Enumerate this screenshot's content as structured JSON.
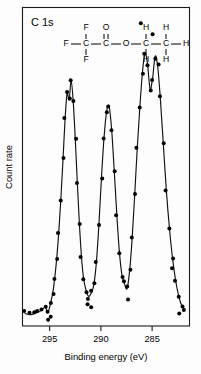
{
  "figure": {
    "panel_label": "C 1s"
  },
  "structure": {
    "name": "ethyl-trifluoroacetate",
    "atoms": [
      {
        "id": "F-left",
        "label": "F",
        "x": 66,
        "y": 44
      },
      {
        "id": "F-top",
        "label": "F",
        "x": 86,
        "y": 28
      },
      {
        "id": "F-bottom",
        "label": "F",
        "x": 86,
        "y": 60
      },
      {
        "id": "C1",
        "label": "C",
        "x": 86,
        "y": 44
      },
      {
        "id": "C2",
        "label": "C",
        "x": 106,
        "y": 44
      },
      {
        "id": "O-double",
        "label": "O",
        "x": 106,
        "y": 28
      },
      {
        "id": "O-ester",
        "label": "O",
        "x": 126,
        "y": 44
      },
      {
        "id": "C3",
        "label": "C",
        "x": 146,
        "y": 44
      },
      {
        "id": "H-c3-top",
        "label": "H",
        "x": 146,
        "y": 28
      },
      {
        "id": "H-c3-bot",
        "label": "H",
        "x": 146,
        "y": 60
      },
      {
        "id": "C4",
        "label": "C",
        "x": 166,
        "y": 44
      },
      {
        "id": "H-c4-top",
        "label": "H",
        "x": 166,
        "y": 28
      },
      {
        "id": "H-c4-bot",
        "label": "H",
        "x": 166,
        "y": 60
      },
      {
        "id": "H-right",
        "label": "H",
        "x": 186,
        "y": 44
      }
    ]
  },
  "chart_data": {
    "type": "line",
    "title": "C 1s",
    "xlabel": "Binding  energy  (eV)",
    "ylabel": "Count  rate",
    "xlim": [
      297.6,
      281.4
    ],
    "ylim": [
      0,
      100
    ],
    "x_ticks": [
      295,
      290,
      285
    ],
    "x_tick_labels": [
      "295",
      "290",
      "285"
    ],
    "y_ticks": [],
    "grid": false,
    "axis_direction": "reversed",
    "legend": null,
    "series": [
      {
        "name": "C 1s photoelectron spectrum",
        "marker": "filled-circle",
        "x": [
          297.4,
          296.95,
          296.55,
          296.15,
          295.8,
          295.45,
          295.15,
          294.9,
          294.7,
          294.5,
          294.3,
          294.1,
          293.9,
          293.7,
          293.5,
          293.3,
          293.1,
          292.9,
          292.7,
          292.5,
          292.3,
          292.1,
          291.9,
          291.7,
          291.45,
          291.2,
          290.95,
          290.7,
          290.45,
          290.2,
          289.95,
          289.7,
          289.45,
          289.2,
          288.95,
          288.7,
          288.45,
          288.2,
          287.95,
          287.7,
          287.45,
          287.2,
          286.95,
          286.7,
          286.45,
          286.2,
          285.95,
          285.7,
          285.45,
          285.2,
          284.95,
          284.7,
          284.45,
          284.2,
          283.9,
          283.6,
          283.3,
          283.0,
          282.7,
          282.4,
          282.1,
          281.85
        ],
        "y": [
          4.0,
          3.6,
          3.9,
          4.4,
          5.0,
          6.0,
          4.6,
          7.5,
          10.5,
          15.5,
          22.0,
          30.5,
          41.0,
          53.0,
          66.0,
          74.5,
          72.5,
          78.5,
          72.0,
          60.0,
          46.0,
          33.0,
          22.5,
          15.5,
          11.5,
          9.5,
          10.5,
          13.0,
          20.0,
          32.0,
          47.0,
          60.0,
          68.5,
          70.5,
          63.0,
          50.0,
          36.0,
          24.0,
          16.5,
          13.5,
          12.0,
          17.5,
          28.0,
          42.0,
          57.0,
          70.0,
          81.0,
          87.5,
          84.0,
          76.0,
          79.5,
          86.5,
          83.0,
          73.0,
          58.0,
          43.0,
          31.0,
          21.5,
          14.5,
          9.5,
          6.5,
          5.5
        ]
      }
    ],
    "peaks": [
      {
        "label": "CF3",
        "binding_energy": 293.0,
        "relative_height": 78
      },
      {
        "label": "C=O",
        "binding_energy": 289.2,
        "relative_height": 71
      },
      {
        "label": "CH2",
        "binding_energy": 285.7,
        "relative_height": 88
      },
      {
        "label": "CH3",
        "binding_energy": 284.7,
        "relative_height": 87
      }
    ],
    "extra_points": [
      {
        "x": 286.1,
        "y": 97.0
      },
      {
        "x": 284.95,
        "y": 93.5
      },
      {
        "x": 291.3,
        "y": 7.0
      },
      {
        "x": 290.95,
        "y": 6.0
      },
      {
        "x": 287.35,
        "y": 8.5
      },
      {
        "x": 295.15,
        "y": 2.0
      },
      {
        "x": 294.9,
        "y": 3.0
      },
      {
        "x": 283.05,
        "y": 18.5
      },
      {
        "x": 282.35,
        "y": 4.0
      }
    ]
  }
}
